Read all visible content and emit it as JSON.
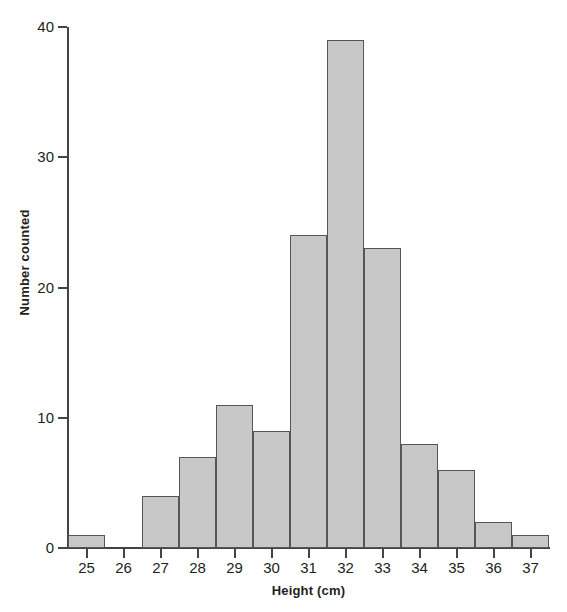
{
  "chart_data": {
    "type": "bar",
    "title": "",
    "xlabel": "Height (cm)",
    "ylabel": "Number counted",
    "categories": [
      "25",
      "26",
      "27",
      "28",
      "29",
      "30",
      "31",
      "32",
      "33",
      "34",
      "35",
      "36",
      "37"
    ],
    "values": [
      1,
      0,
      4,
      7,
      11,
      9,
      24,
      39,
      23,
      8,
      6,
      2,
      1
    ],
    "xlim": [
      24.5,
      37.5
    ],
    "ylim": [
      0,
      40
    ],
    "y_ticks": [
      0,
      10,
      20,
      30,
      40
    ],
    "y_tick_labels": [
      "0",
      "10",
      "20",
      "30",
      "40"
    ],
    "x_ticks": [
      25,
      26,
      27,
      28,
      29,
      30,
      31,
      32,
      33,
      34,
      35,
      36,
      37
    ],
    "x_tick_labels": [
      "25",
      "26",
      "27",
      "28",
      "29",
      "30",
      "31",
      "32",
      "33",
      "34",
      "35",
      "36",
      "37"
    ],
    "grid": false,
    "legend": null,
    "bar_fill_color": "#c8c8c8",
    "bar_edge_color": "#565656",
    "axis_color": "#444444",
    "text_color": "#231f20",
    "background_color": "#ffffff"
  },
  "axes": {
    "y_title": "Number counted",
    "x_title": "Height (cm)"
  }
}
